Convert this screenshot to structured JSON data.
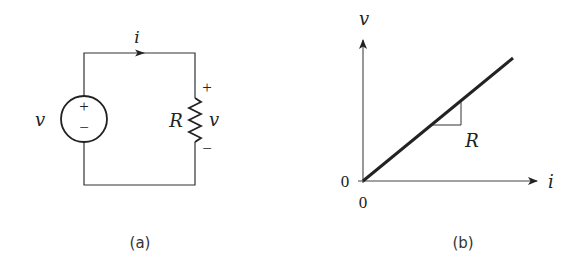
{
  "figure_a": {
    "caption": "(a)",
    "source_label": "v",
    "source_plus": "+",
    "source_minus": "−",
    "current_label": "i",
    "resistor_label": "R",
    "resistor_voltage_label": "v",
    "resistor_plus": "+",
    "resistor_minus": "−"
  },
  "figure_b": {
    "caption": "(b)",
    "y_axis_label": "v",
    "x_axis_label": "i",
    "y_origin_tick": "0",
    "x_origin_tick": "0",
    "slope_label": "R"
  },
  "colors": {
    "stroke": "#222222",
    "background": "#ffffff"
  }
}
